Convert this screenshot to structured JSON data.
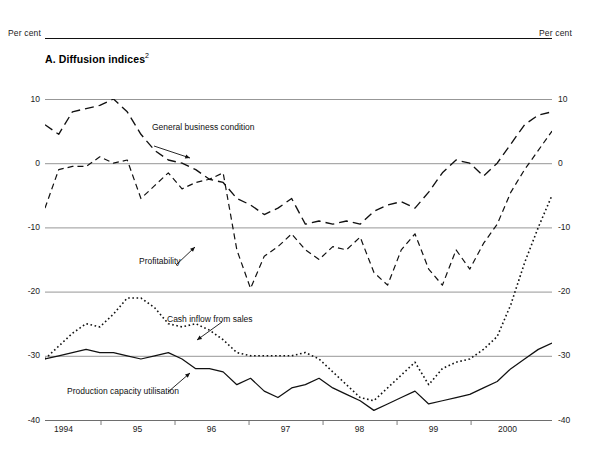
{
  "header": {
    "percent_left": "Per cent",
    "percent_right": "Per cent"
  },
  "panel": {
    "title": "A.  Diffusion indices",
    "title_superscript": "2"
  },
  "annotations": {
    "general_business_condition": "General business condition",
    "profitability": "Profitability",
    "cash_inflow_from_sales": "Cash inflow from sales",
    "production_capacity_utilisation": "Production capacity utilisation"
  },
  "axis": {
    "y_ticks": [
      "10",
      "0",
      "-10",
      "-20",
      "-30",
      "-40"
    ],
    "y_values": [
      10,
      0,
      -10,
      -20,
      -30,
      -40
    ],
    "x_ticks": [
      "1994",
      "95",
      "96",
      "97",
      "98",
      "99",
      "2000"
    ]
  },
  "colors": {
    "ink": "#111111",
    "gridline": "#8b8b8b",
    "axis": "#6e6e6e"
  },
  "chart_data": {
    "type": "line",
    "title": "A.  Diffusion indices",
    "xlabel": "",
    "ylabel": "Per cent",
    "ylim": [
      -40,
      10
    ],
    "xlim": [
      1993.75,
      2000.6
    ],
    "grid": true,
    "legend": "annotations-inline",
    "yticks": [
      10,
      0,
      -10,
      -20,
      -30,
      -40
    ],
    "xticks": [
      1994,
      1995,
      1996,
      1997,
      1998,
      1999,
      2000
    ],
    "xtick_labels": [
      "1994",
      "95",
      "96",
      "97",
      "98",
      "99",
      "2000"
    ],
    "x": [
      1993.75,
      1994.0,
      1994.25,
      1994.5,
      1994.75,
      1995.0,
      1995.25,
      1995.5,
      1995.75,
      1996.0,
      1996.25,
      1996.5,
      1996.75,
      1997.0,
      1997.25,
      1997.5,
      1997.75,
      1998.0,
      1998.25,
      1998.5,
      1998.75,
      1999.0,
      1999.25,
      1999.5,
      1999.75,
      2000.0,
      2000.25,
      2000.5
    ],
    "series": [
      {
        "name": "General business condition",
        "style": "long-dash",
        "values": [
          6.0,
          4.5,
          8.0,
          8.5,
          9.0,
          10.0,
          8.0,
          4.5,
          2.0,
          0.5,
          0.0,
          -1.0,
          -2.5,
          -3.0,
          -5.5,
          -6.5,
          -8.0,
          -7.0,
          -5.5,
          -9.5,
          -9.0,
          -9.5,
          -9.0,
          -9.5,
          -7.5,
          -6.5,
          -6.0,
          -7.0
        ]
      },
      {
        "name": "Profitability",
        "style": "medium-dash",
        "values": [
          -7.0,
          -1.0,
          -0.5,
          -0.5,
          1.0,
          0.0,
          0.5,
          -5.5,
          -3.5,
          -1.5,
          -4.0,
          -3.0,
          -2.5,
          -1.5,
          -13.5,
          -19.5,
          -14.5,
          -13.0,
          -11.0,
          -13.5,
          -15.0,
          -13.0,
          -13.5,
          -11.5,
          -17.0,
          -19.0,
          -13.5,
          -11.0
        ]
      },
      {
        "name": "Cash inflow from sales",
        "style": "dotted",
        "values": [
          -30.5,
          -28.5,
          -26.5,
          -25.0,
          -25.5,
          -23.5,
          -21.0,
          -21.0,
          -22.5,
          -25.0,
          -25.5,
          -25.0,
          -26.0,
          -27.5,
          -29.5,
          -30.0,
          -30.0,
          -30.0,
          -30.0,
          -29.5,
          -30.5,
          -32.5,
          -34.5,
          -36.5,
          -37.0,
          -35.0,
          -33.0,
          -31.0
        ]
      },
      {
        "name": "Production capacity utilisation",
        "style": "solid",
        "values": [
          -30.5,
          -30.0,
          -29.5,
          -29.0,
          -29.5,
          -29.5,
          -30.0,
          -30.5,
          -30.0,
          -29.5,
          -30.5,
          -32.0,
          -32.0,
          -32.5,
          -34.5,
          -33.5,
          -35.5,
          -36.5,
          -35.0,
          -34.5,
          -33.5,
          -35.0,
          -36.0,
          -37.0,
          -38.5,
          -37.5,
          -36.5,
          -35.5
        ]
      }
    ],
    "series_late": {
      "note": "tail of each series rising toward 2000",
      "General business condition": [
        -7.0,
        -4.5,
        -1.5,
        0.5,
        0.0,
        -2.0,
        0.0,
        3.0,
        6.0,
        7.5,
        8.0
      ],
      "Profitability": [
        -14.5,
        -16.5,
        -19.0,
        -13.5,
        -16.5,
        -12.5,
        -9.5,
        -4.5,
        -1.0,
        2.0,
        5.0
      ],
      "Cash inflow from sales": [
        -36.5,
        -34.5,
        -32.0,
        -31.0,
        -30.5,
        -29.0,
        -27.0,
        -22.0,
        -15.5,
        -10.0,
        -5.0
      ],
      "Production capacity utilisation": [
        -38.5,
        -37.5,
        -37.0,
        -36.5,
        -36.0,
        -35.0,
        -34.0,
        -32.0,
        -30.5,
        -29.0,
        -28.0
      ]
    }
  }
}
